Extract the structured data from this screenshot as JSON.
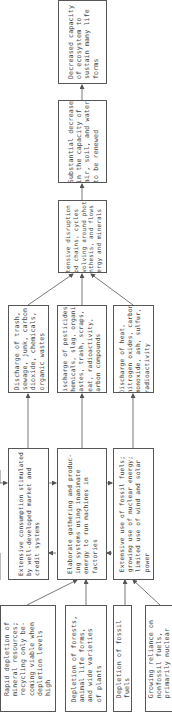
{
  "diagram": {
    "orientation": "rotated 90 degrees counter-clockwise; flow goes from bottom to top",
    "boxes": {
      "decreased_capacity": {
        "label": "Decreased capacity\nof ecosystem to\nsustain many life\nforms"
      },
      "substantial_decrease": {
        "label": "Substantial decrease\nin the capacity of\nair, soil, and water\nto be renewed"
      },
      "extensive_disruption": {
        "label": "Extensive disruption of\nfood chains, cycles\nrevolving around photo-\nsynthesis, and flows of\nenergy and minerals"
      },
      "discharge_trash": {
        "label": "Discharge of trash,\nsewage, junk, carbon\ndioxide, chemicals,\norganic wastes"
      },
      "discharge_pesticides": {
        "label": "Discharge of pesticides,\nchemicals, slag, organic\nwastes, trash, scraps,\nheat, radioactivity,\ncarbon compounds"
      },
      "discharge_heat": {
        "label": "Discharge of heat,\nnitrogen oxides, carbon\nmonoxide, ash, sulfur,\nradioactivity"
      },
      "extensive_consumption": {
        "label": "Extensive consumption stimulated\nby well-developed market and\ncredit systems"
      },
      "elaborate_gathering": {
        "label": "Elaborate gathering and produc-\ning systems using inanimate\nenergy to run machines in\nfactories"
      },
      "extensive_fossil_use": {
        "label": "Extensive use of fossil fuels;\ngrowing use of nuclear energy;\nlimited use of wind and solar\npower"
      },
      "rapid_depletion": {
        "label": "Rapid depletion of\nmineral resources;\nrecycling only be-\ncoming viable when\ndepletion levels\nhigh"
      },
      "depletion_forests": {
        "label": "Depletion of forests,\nanimal life forms,\nand wide varieties\nof plants"
      },
      "depletion_fossil": {
        "label": "Depletion of fossil\nfuels"
      },
      "growing_reliance": {
        "label": "Growing reliance on\nnonfossil fuels,\nprimarily nuclear"
      }
    },
    "edges": [
      [
        "substantial_decrease",
        "decreased_capacity"
      ],
      [
        "extensive_disruption",
        "substantial_decrease"
      ],
      [
        "discharge_trash",
        "extensive_disruption"
      ],
      [
        "discharge_pesticides",
        "extensive_disruption"
      ],
      [
        "discharge_heat",
        "extensive_disruption"
      ],
      [
        "extensive_consumption",
        "discharge_trash"
      ],
      [
        "elaborate_gathering",
        "discharge_pesticides"
      ],
      [
        "extensive_fossil_use",
        "discharge_heat"
      ],
      [
        "extensive_consumption",
        "elaborate_gathering"
      ],
      [
        "elaborate_gathering",
        "extensive_consumption"
      ],
      [
        "elaborate_gathering",
        "extensive_fossil_use"
      ],
      [
        "extensive_fossil_use",
        "elaborate_gathering"
      ],
      [
        "rapid_depletion",
        "elaborate_gathering"
      ],
      [
        "depletion_forests",
        "elaborate_gathering"
      ],
      [
        "depletion_fossil",
        "extensive_fossil_use"
      ],
      [
        "growing_reliance",
        "extensive_fossil_use"
      ]
    ],
    "colors": {
      "line": "#555555",
      "text": "#444444",
      "background": "#ffffff"
    }
  }
}
